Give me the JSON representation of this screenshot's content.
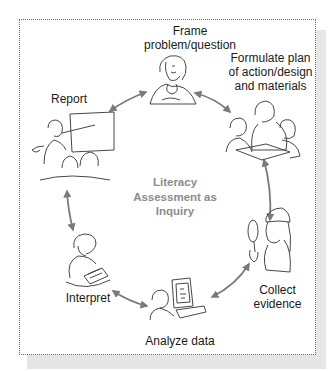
{
  "diagram": {
    "type": "cycle",
    "center_title": {
      "lines": [
        "Literacy",
        "Assessment as",
        "Inquiry"
      ],
      "color": "#8c8c8c"
    },
    "stages": [
      {
        "id": "frame",
        "lines": [
          "Frame",
          "problem/question"
        ],
        "illustration": "thinking-person-icon"
      },
      {
        "id": "formulate",
        "lines": [
          "Formulate plan",
          "of action/design",
          "and materials"
        ],
        "illustration": "group-planning-icon"
      },
      {
        "id": "collect",
        "lines": [
          "Collect",
          "evidence"
        ],
        "illustration": "detective-magnifier-icon"
      },
      {
        "id": "analyze",
        "lines": [
          "Analyze data"
        ],
        "illustration": "computer-user-icon"
      },
      {
        "id": "interpret",
        "lines": [
          "Interpret"
        ],
        "illustration": "person-writing-icon"
      },
      {
        "id": "report",
        "lines": [
          "Report"
        ],
        "illustration": "presenter-audience-icon"
      }
    ],
    "connections": [
      {
        "from": "frame",
        "to": "formulate",
        "style": "double-arrow"
      },
      {
        "from": "formulate",
        "to": "collect",
        "style": "double-arrow"
      },
      {
        "from": "collect",
        "to": "analyze",
        "style": "double-arrow"
      },
      {
        "from": "analyze",
        "to": "interpret",
        "style": "double-arrow"
      },
      {
        "from": "interpret",
        "to": "report",
        "style": "double-arrow"
      },
      {
        "from": "report",
        "to": "frame",
        "style": "double-arrow"
      }
    ],
    "colors": {
      "arrow": "#7a7a7a",
      "border": "#6a6a6a",
      "shadow": "#e6e6e6",
      "text": "#1a1a1a"
    }
  }
}
